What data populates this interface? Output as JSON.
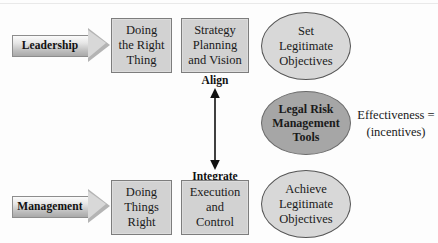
{
  "diagram": {
    "lanes": [
      {
        "arrow_label": "Leadership",
        "box1": "Doing\nthe Right\nThing",
        "box2": "Strategy\nPlanning\nand Vision",
        "ellipse": "Set\nLegitimate\nObjectives"
      },
      {
        "arrow_label": "Management",
        "box1": "Doing\nThings\nRight",
        "box2": "Execution\nand\nControl",
        "ellipse": "Achieve\nLegitimate\nObjectives"
      }
    ],
    "connector": {
      "top_label": "Align",
      "bottom_label": "Integrate"
    },
    "center_ellipse": "Legal Risk\nManagement\nTools",
    "side_note": {
      "line1": "Effectiveness =",
      "line2": "(incentives)"
    },
    "colors": {
      "box_fill": "#d2d2d2",
      "box_border": "#7d7d7d",
      "ellipse_light_fill": "#d8d8d8",
      "ellipse_dark_fill": "#a6a6a6",
      "arrow_fill": "#bdbdbd",
      "text": "#1a1a1a"
    }
  }
}
